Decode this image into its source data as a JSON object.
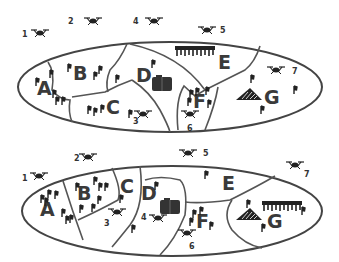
{
  "diagram": {
    "type": "map-partition-comparison",
    "panels": [
      {
        "id": "top",
        "regions": [
          "A",
          "B",
          "C",
          "D",
          "E",
          "F",
          "G"
        ],
        "drones": [
          {
            "id": "1",
            "label": "1"
          },
          {
            "id": "2",
            "label": "2"
          },
          {
            "id": "3",
            "label": "3"
          },
          {
            "id": "4",
            "label": "4"
          },
          {
            "id": "5",
            "label": "5"
          },
          {
            "id": "6",
            "label": "6"
          },
          {
            "id": "7",
            "label": "7"
          }
        ],
        "features": [
          "forest-in-E",
          "building-in-D",
          "mountain-in-G"
        ]
      },
      {
        "id": "bottom",
        "regions": [
          "A",
          "B",
          "C",
          "D",
          "E",
          "F",
          "G"
        ],
        "drones": [
          {
            "id": "1",
            "label": "1"
          },
          {
            "id": "2",
            "label": "2"
          },
          {
            "id": "3",
            "label": "3"
          },
          {
            "id": "4",
            "label": "4"
          },
          {
            "id": "5",
            "label": "5"
          },
          {
            "id": "6",
            "label": "6"
          },
          {
            "id": "7",
            "label": "7"
          }
        ],
        "features": [
          "building-in-D",
          "mountain-in-G",
          "forest-in-G"
        ]
      }
    ]
  },
  "labels": {
    "top": {
      "A": "A",
      "B": "B",
      "C": "C",
      "D": "D",
      "E": "E",
      "F": "F",
      "G": "G",
      "d1": "1",
      "d2": "2",
      "d3": "3",
      "d4": "4",
      "d5": "5",
      "d6": "6",
      "d7": "7"
    },
    "bottom": {
      "A": "A",
      "B": "B",
      "C": "C",
      "D": "D",
      "E": "E",
      "F": "F",
      "G": "G",
      "d1": "1",
      "d2": "2",
      "d3": "3",
      "d4": "4",
      "d5": "5",
      "d6": "6",
      "d7": "7"
    }
  },
  "colors": {
    "stroke": "#444444",
    "label": "#3a3a3a",
    "icon": "#222222"
  }
}
